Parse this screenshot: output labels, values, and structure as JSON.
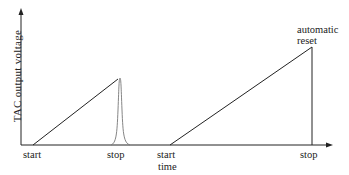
{
  "diagram": {
    "y_axis_label": "TAC output voltage",
    "labels": {
      "start1": "start",
      "stop1": "stop",
      "start2": "start",
      "time": "time",
      "stop2": "stop",
      "automatic": "automatic",
      "reset": "reset"
    },
    "colors": {
      "line": "#222222",
      "pulse": "#777777",
      "background": "#ffffff"
    }
  }
}
